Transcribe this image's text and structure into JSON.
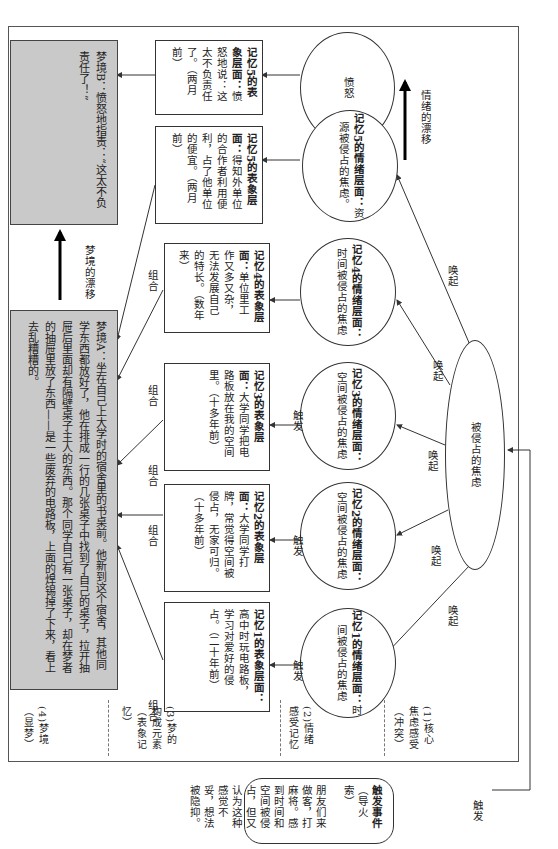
{
  "layers": [
    {
      "id": 4,
      "label": "(4)梦境（显梦）"
    },
    {
      "id": 3,
      "label": "(3)梦的构成元素（表象记忆）"
    },
    {
      "id": 2,
      "label": "(2)情绪感受记忆"
    },
    {
      "id": 1,
      "label": "(1)核心焦虑感受（冲突）"
    }
  ],
  "dreams": {
    "a": {
      "text": "梦境A：坐在自己上大学时的宿舍里的书桌前。他新到这个宿舍，其他同学东西都放好了，他在排成一行的几张桌子中找到了自己的桌子，拉开抽屉后里面却有隔壁桌子主人的东西。那个同学自己有一张桌子，却在梦者的抽屉里放了东西——是一些废弃的电路板，上面的焊锡掉了下来，看上去乱糟糟的。"
    },
    "b": {
      "text": "梦境B：愤怒地指责：“这太不负责任了！”"
    },
    "drift_label": "梦境的漂移"
  },
  "memories": [
    {
      "title": "记忆1的表象层面：",
      "body": "高中时玩电路板，学习对爱好的侵占。",
      "time": "（二十年前）",
      "emotion_title": "记忆1的情绪层面：",
      "emotion": "时间被侵占的焦虑"
    },
    {
      "title": "记忆2的表象层面：",
      "body": "大学同学打牌，常觉得空间被侵占，无家可归。",
      "time": "（十多年前）",
      "emotion_title": "记忆2的情绪层面：",
      "emotion": "空间被侵占的焦虑"
    },
    {
      "title": "记忆3的表象层面：",
      "body": "大学同学把电路板放在我的空间里。",
      "time": "（十多年前）",
      "emotion_title": "记忆3的情绪层面：",
      "emotion": "空间被侵占的焦虑"
    },
    {
      "title": "记忆4的表象层面：",
      "body": "单位里工作又多又杂，无法发展自己的特长。",
      "time": "（数年来）",
      "emotion_title": "记忆4的情绪层面：",
      "emotion": "时间被侵占的焦虑"
    },
    {
      "title": "记忆5的表象层面：",
      "body": "得知外单位的合作者利用便利，占了他单位的便宜。",
      "time": "（两月前）",
      "emotion_title": "记忆5的情绪层面：",
      "emotion": "资源被侵占的焦虑。"
    }
  ],
  "memory5b": {
    "title": "记忆5的表象层面：",
    "body": "愤怒地说：这太不负责任了。",
    "time": "（两月前）",
    "emotion": "愤怒"
  },
  "core": {
    "text": "被侵占的焦虑"
  },
  "edge_labels": {
    "combine": "组合",
    "trigger": "触发",
    "evoke": "唤起"
  },
  "emotion_drift_label": "情绪的漂移",
  "trigger_event": {
    "title": "触发事件",
    "subtitle": "（导火索）",
    "body": "朋友们来做客，打麻将。感到时间和空间被侵占，但又认为这种感觉不妥，想法被隐抑。"
  }
}
